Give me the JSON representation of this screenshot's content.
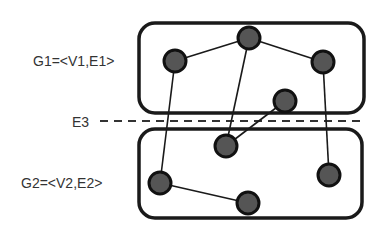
{
  "diagram": {
    "labels": {
      "g1": "G1=<V1,E1>",
      "g2": "G2=<V2,E2>",
      "e3": "E3"
    },
    "colors": {
      "node_fill": "#555555",
      "stroke": "#1a1a1a",
      "background": "#ffffff"
    },
    "groups": [
      {
        "id": "G1",
        "nodes": [
          "v1a",
          "v1b",
          "v1c",
          "v1d"
        ]
      },
      {
        "id": "G2",
        "nodes": [
          "v2a",
          "v2b",
          "v2c",
          "v2d"
        ]
      }
    ],
    "edges": [
      {
        "from": "v1a",
        "to": "v1b",
        "set": "E1"
      },
      {
        "from": "v1b",
        "to": "v1c",
        "set": "E1"
      },
      {
        "from": "v2b",
        "to": "v2c",
        "set": "E2"
      },
      {
        "from": "v1a",
        "to": "v2b",
        "set": "E3"
      },
      {
        "from": "v1b",
        "to": "v2a",
        "set": "E3"
      },
      {
        "from": "v1d",
        "to": "v2a",
        "set": "E3"
      },
      {
        "from": "v1c",
        "to": "v2d",
        "set": "E3"
      }
    ]
  }
}
